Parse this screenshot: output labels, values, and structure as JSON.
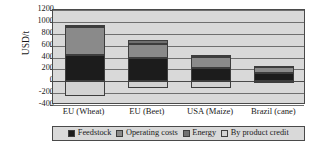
{
  "chart_data": {
    "type": "bar",
    "subtype": "stacked-with-negative",
    "title": "",
    "xlabel": "",
    "ylabel": "USD/t",
    "ylim": [
      -400,
      1200
    ],
    "ytick_step": 200,
    "ytick_labels": [
      "1200",
      "1000",
      "800",
      "600",
      "400",
      "200",
      "0",
      "-200",
      "-400"
    ],
    "grid": true,
    "legend_position": "bottom",
    "categories": [
      "EU (Wheat)",
      "EU (Beet)",
      "USA (Maize)",
      "Brazil (cane)"
    ],
    "series": [
      {
        "name": "Feedstock",
        "color": "#1c1c1c",
        "values": [
          450,
          385,
          220,
          140
        ]
      },
      {
        "name": "Operating costs",
        "color": "#8a8a8a",
        "values": [
          470,
          250,
          190,
          105
        ]
      },
      {
        "name": "Energy",
        "color": "#707070",
        "values": [
          30,
          65,
          40,
          10
        ]
      },
      {
        "name": "By product credit",
        "color": "#d2d2d2",
        "values": [
          -250,
          -120,
          -120,
          -10
        ]
      }
    ],
    "bar_totals_positive": [
      950,
      700,
      450,
      255
    ],
    "bar_bottoms_negative": [
      -250,
      -120,
      -120,
      -10
    ]
  },
  "colors": {
    "plot_background": "#d9d9d9",
    "axis": "#4a4a4a",
    "gridline": "#6f6f6f",
    "text": "#1a1a1a",
    "page_background": "#ffffff"
  },
  "legend": {
    "items": [
      {
        "label": "Feedstock",
        "color": "#1c1c1c"
      },
      {
        "label": "Operating costs",
        "color": "#8a8a8a"
      },
      {
        "label": "Energy",
        "color": "#707070"
      },
      {
        "label": "By product credit",
        "color": "#d2d2d2"
      }
    ]
  }
}
